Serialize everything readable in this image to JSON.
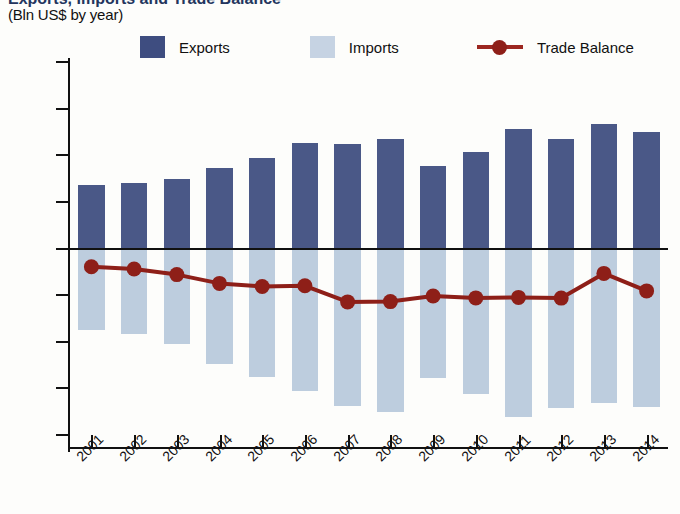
{
  "header": {
    "title_partial": "Exports, Imports and Trade Balance",
    "subtitle": "(Bln US$ by year)"
  },
  "legend": {
    "items": [
      {
        "label": "Exports",
        "color": "#4a5887",
        "marker": "square"
      },
      {
        "label": "Imports",
        "color": "#bdcdde",
        "marker": "square"
      },
      {
        "label": "Trade Balance",
        "color": "#8e1f18",
        "marker": "line-dot"
      }
    ]
  },
  "chart_data": {
    "type": "bar",
    "title": "Exports, Imports and Trade Balance",
    "subtitle": "(Bln US$ by year)",
    "xlabel": "",
    "ylabel": "Bln US$",
    "ylim": [
      -800,
      800
    ],
    "ytick_step": 200,
    "yticks": [
      800,
      600,
      400,
      200,
      0,
      -200,
      -400,
      -600,
      -800
    ],
    "ytick_labels": [
      "800",
      "600",
      "400",
      "200",
      "0",
      "−200",
      "−400",
      "−600",
      "−800"
    ],
    "grid": false,
    "legend_position": "top",
    "categories": [
      "2001",
      "2002",
      "2003",
      "2004",
      "2005",
      "2006",
      "2007",
      "2008",
      "2009",
      "2010",
      "2011",
      "2012",
      "2013",
      "2014"
    ],
    "series": [
      {
        "name": "Exports",
        "type": "bar",
        "color": "#4a5887",
        "values": [
          272,
          280,
          300,
          345,
          390,
          452,
          448,
          472,
          352,
          413,
          512,
          470,
          535,
          500
        ]
      },
      {
        "name": "Imports",
        "type": "bar",
        "color": "#bdcdde",
        "values": [
          -350,
          -368,
          -412,
          -495,
          -553,
          -612,
          -677,
          -700,
          -556,
          -625,
          -722,
          -683,
          -662,
          -682
        ]
      },
      {
        "name": "Trade Balance",
        "type": "line",
        "color": "#8e1f18",
        "values": [
          -78,
          -88,
          -112,
          -150,
          -163,
          -160,
          -229,
          -228,
          -204,
          -212,
          -210,
          -213,
          -107,
          -182
        ]
      }
    ]
  }
}
